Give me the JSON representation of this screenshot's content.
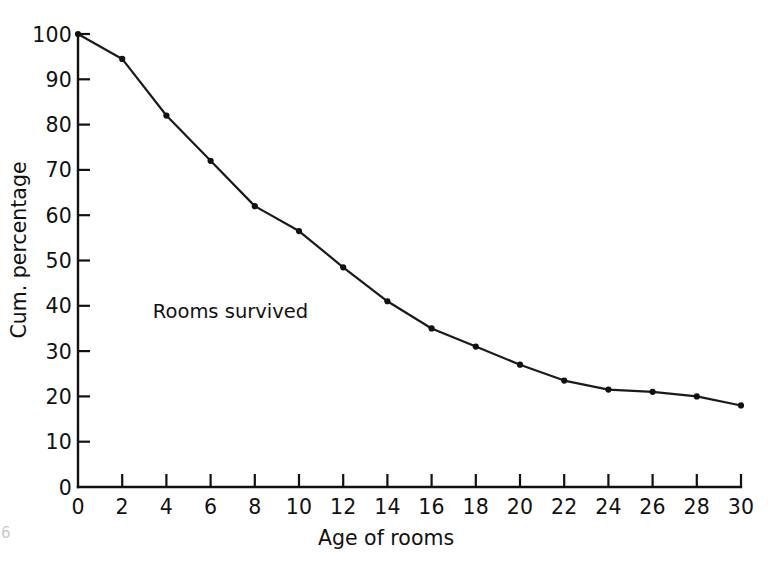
{
  "figure": {
    "background_color": "#ffffff",
    "ink_color": "#111111",
    "page_artifact": "6"
  },
  "chart_data": {
    "type": "line",
    "title": "",
    "xlabel": "Age of rooms",
    "ylabel": "Cum. percentage",
    "xlim": [
      0,
      30
    ],
    "ylim": [
      0,
      100
    ],
    "grid": false,
    "legend": "none",
    "annotations": [
      {
        "text": "Rooms survived",
        "x": 6.9,
        "y": 37.3
      }
    ],
    "xticks": [
      0,
      2,
      4,
      6,
      8,
      10,
      12,
      14,
      16,
      18,
      20,
      22,
      24,
      26,
      28,
      30
    ],
    "xtick_labels": [
      "0",
      "2",
      "4",
      "6",
      "8",
      "10",
      "12",
      "14",
      "16",
      "18",
      "20",
      "22",
      "24",
      "26",
      "28",
      "30"
    ],
    "yticks": [
      0,
      10,
      20,
      30,
      40,
      50,
      60,
      70,
      80,
      90,
      100
    ],
    "ytick_labels": [
      "0",
      "10",
      "20",
      "30",
      "40",
      "50",
      "60",
      "70",
      "80",
      "90",
      "100"
    ],
    "series": [
      {
        "name": "Rooms survived",
        "marker": "dot",
        "color": "#111111",
        "x": [
          0,
          2,
          4,
          6,
          8,
          10,
          12,
          14,
          16,
          18,
          20,
          22,
          24,
          26,
          28,
          30
        ],
        "values": [
          100,
          94.5,
          82,
          72,
          62,
          56.5,
          48.5,
          41,
          35,
          31,
          27,
          23.5,
          21.5,
          21,
          20,
          18
        ]
      }
    ]
  }
}
